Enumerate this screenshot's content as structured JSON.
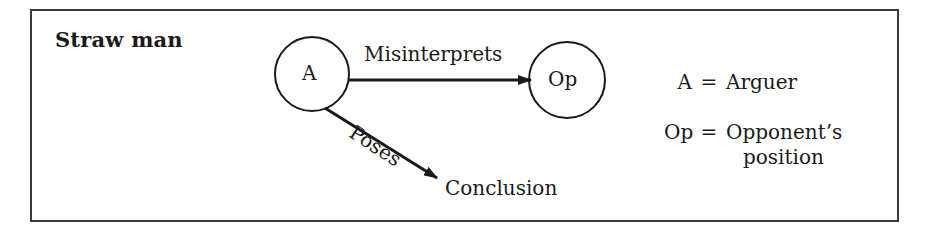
{
  "title": "Straw man",
  "nodes": {
    "arguer": {
      "label": "A"
    },
    "opponent": {
      "label": "Op"
    },
    "conclusion": {
      "label": "Conclusion"
    }
  },
  "edges": {
    "misinterprets": {
      "label": "Misinterprets",
      "from": "A",
      "to": "Op"
    },
    "poses": {
      "label": "Poses",
      "from": "A",
      "to": "Conclusion"
    }
  },
  "legend": [
    {
      "key": "A",
      "eq": "=",
      "value": "Arguer"
    },
    {
      "key": "Op",
      "eq": "=",
      "value": "Opponent’s",
      "value_line2": "position"
    }
  ],
  "colors": {
    "stroke": "#1a1a1a",
    "frame": "#3a3a3a",
    "background": "#ffffff"
  }
}
